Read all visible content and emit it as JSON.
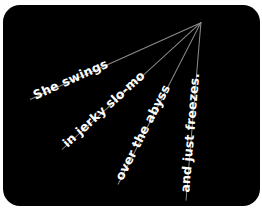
{
  "panel": {
    "background": "#000000",
    "corner_radius_px": 17
  },
  "convergence_point": {
    "x": 201,
    "y": 22
  },
  "rays": [
    {
      "text": "She swings",
      "start": {
        "x": 30,
        "y": 99
      },
      "length": 187.5,
      "angle_deg": -24.2,
      "text_offset": 5
    },
    {
      "text": "in jerky slo-mo",
      "start": {
        "x": 62,
        "y": 149
      },
      "length": 188.3,
      "angle_deg": -42.4,
      "text_offset": 5
    },
    {
      "text": "over the abyss",
      "start": {
        "x": 118,
        "y": 184
      },
      "length": 182,
      "angle_deg": -62.9,
      "text_offset": 5
    },
    {
      "text": "and just freezes.",
      "start": {
        "x": 186,
        "y": 200
      },
      "length": 178.6,
      "angle_deg": -85.2,
      "text_offset": 8
    }
  ],
  "colors": {
    "text": "#ffffff",
    "line": "#8c8c8c"
  }
}
